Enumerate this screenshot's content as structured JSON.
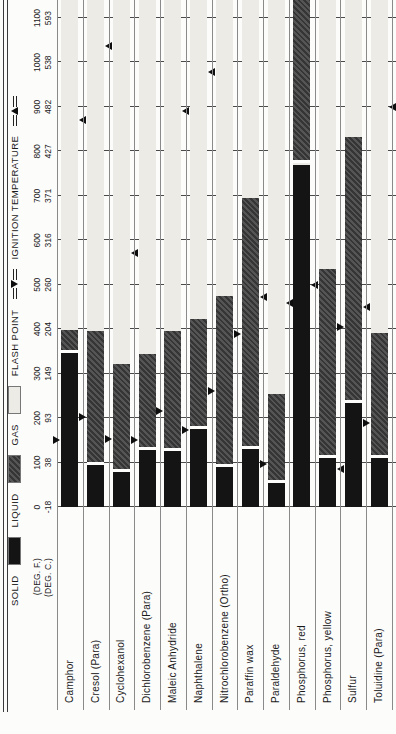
{
  "page": {
    "background": "#fcfcfa"
  },
  "legend": {
    "solid_label": "SOLID",
    "liquid_label": "LIQUID",
    "gas_label": "GAS",
    "flash_label": "FLASH POINT",
    "ignition_label": "IGNITION TEMPERATURE"
  },
  "axis": {
    "deg_f": "(DEG. F.)",
    "deg_c": "(DEG. C.)"
  },
  "chart_data": {
    "type": "bar",
    "subtype": "stacked horizontal phase bars with flash-point and ignition-temperature markers",
    "layout_hint": "entire chart rotated 90deg CCW on the page; temperature axis 0-1100 deg F with deg C equivalents; grid on at every 100 F",
    "unit_primary": "DEG. F.",
    "unit_secondary": "DEG. C.",
    "x_axis": {
      "min_f": 0,
      "max_f": 1140,
      "gridline_step_f": 100,
      "ticks": [
        {
          "f": "0",
          "c": "-18"
        },
        {
          "f": "100",
          "c": "38"
        },
        {
          "f": "200",
          "c": "93"
        },
        {
          "f": "300",
          "c": "149"
        },
        {
          "f": "400",
          "c": "204"
        },
        {
          "f": "500",
          "c": "260"
        },
        {
          "f": "600",
          "c": "316"
        },
        {
          "f": "700",
          "c": "371"
        },
        {
          "f": "800",
          "c": "427"
        },
        {
          "f": "900",
          "c": "482"
        },
        {
          "f": "1000",
          "c": "538"
        },
        {
          "f": "1100",
          "c": "593"
        }
      ]
    },
    "phase_colors": {
      "solid": "#141414",
      "liquid": "#464646",
      "gas": "#ecebe5"
    },
    "marker_meaning": {
      "down_arrow": "flash point",
      "up_arrow": "ignition temperature"
    },
    "rows": [
      {
        "name": "Camphor",
        "solid_f": [
          0,
          347
        ],
        "liquid_f": [
          347,
          399
        ],
        "gas_from_f": 399,
        "flash_point_f": 150,
        "ignition_temp_f": 871
      },
      {
        "name": "Cresol (Para)",
        "solid_f": [
          0,
          95
        ],
        "liquid_f": [
          95,
          395
        ],
        "gas_from_f": 395,
        "flash_point_f": 202,
        "ignition_temp_f": 1038
      },
      {
        "name": "Cyclohexanol",
        "solid_f": [
          0,
          78
        ],
        "liquid_f": [
          78,
          322
        ],
        "gas_from_f": 322,
        "flash_point_f": 154,
        "ignition_temp_f": 572
      },
      {
        "name": "Dichlorobenzene (Para)",
        "solid_f": [
          0,
          128
        ],
        "liquid_f": [
          128,
          345
        ],
        "gas_from_f": 345,
        "flash_point_f": 150,
        "ignition_temp_f": null
      },
      {
        "name": "Maleic Anhydride",
        "solid_f": [
          0,
          127
        ],
        "liquid_f": [
          127,
          396
        ],
        "gas_from_f": 396,
        "flash_point_f": 215,
        "ignition_temp_f": 890
      },
      {
        "name": "Naphthalene",
        "solid_f": [
          0,
          176
        ],
        "liquid_f": [
          176,
          424
        ],
        "gas_from_f": 424,
        "flash_point_f": 174,
        "ignition_temp_f": 979
      },
      {
        "name": "Nitrochlorobenzene (Ortho)",
        "solid_f": [
          0,
          90
        ],
        "liquid_f": [
          90,
          475
        ],
        "gas_from_f": 475,
        "flash_point_f": 261,
        "ignition_temp_f": null
      },
      {
        "name": "Paraffin wax",
        "solid_f": [
          0,
          130
        ],
        "liquid_f": [
          130,
          695
        ],
        "gas_from_f": 695,
        "flash_point_f": 390,
        "ignition_temp_f": 473
      },
      {
        "name": "Paraldehyde",
        "solid_f": [
          0,
          54
        ],
        "liquid_f": [
          54,
          255
        ],
        "gas_from_f": 255,
        "flash_point_f": 96,
        "ignition_temp_f": 460
      },
      {
        "name": "Phosphorus, red",
        "solid_f": [
          0,
          770
        ],
        "liquid_f": [
          775,
          1140
        ],
        "gas_from_f": null,
        "flash_point_f": null,
        "ignition_temp_f": 500
      },
      {
        "name": "Phosphorus, yellow",
        "solid_f": [
          0,
          111
        ],
        "liquid_f": [
          111,
          536
        ],
        "gas_from_f": 536,
        "flash_point_f": null,
        "ignition_temp_f": 86
      },
      {
        "name": "Sulfur",
        "solid_f": [
          0,
          235
        ],
        "liquid_f": [
          235,
          832
        ],
        "gas_from_f": 832,
        "flash_point_f": 405,
        "ignition_temp_f": 450
      },
      {
        "name": "Toluidine (Para)",
        "solid_f": [
          0,
          110
        ],
        "liquid_f": [
          110,
          392
        ],
        "gas_from_f": 392,
        "flash_point_f": 188,
        "ignition_temp_f": 900
      }
    ]
  }
}
